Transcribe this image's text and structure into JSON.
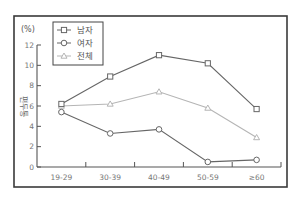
{
  "chart_data": {
    "type": "line",
    "title": "",
    "unit_label": "(%)",
    "xlabel": "",
    "ylabel": "편두통",
    "ylim": [
      0,
      12
    ],
    "yticks": [
      0,
      2,
      4,
      6,
      8,
      10,
      12
    ],
    "grid": false,
    "legend_position": "top-left",
    "categories": [
      "19-29",
      "30-39",
      "40-49",
      "50-59",
      "≥60"
    ],
    "series": [
      {
        "name": "남자",
        "marker": "square",
        "color": "#666666",
        "values": [
          6.2,
          8.9,
          11.0,
          10.2,
          5.7
        ]
      },
      {
        "name": "여자",
        "marker": "circle",
        "color": "#666666",
        "values": [
          5.4,
          3.3,
          3.7,
          0.5,
          0.7
        ]
      },
      {
        "name": "전체",
        "marker": "triangle",
        "color": "#b5b5b5",
        "values": [
          6.0,
          6.2,
          7.4,
          5.8,
          2.9
        ]
      }
    ]
  }
}
